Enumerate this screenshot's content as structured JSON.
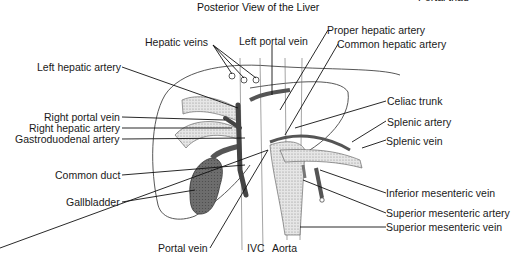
{
  "title": "Posterior View of the Liver",
  "corner_label": "Portal triad",
  "labels": {
    "hepatic_veins": "Hepatic veins",
    "left_portal_vein": "Left portal vein",
    "proper_hepatic_artery": "Proper hepatic artery",
    "common_hepatic_artery": "Common hepatic artery",
    "left_hepatic_artery": "Left hepatic artery",
    "right_portal_vein": "Right portal vein",
    "right_hepatic_artery": "Right hepatic artery",
    "gastroduodenal_artery": "Gastroduodenal artery",
    "celiac_trunk": "Celiac trunk",
    "splenic_artery": "Splenic artery",
    "splenic_vein": "Splenic vein",
    "common_duct": "Common duct",
    "gallbladder": "Gallbladder",
    "inferior_mesenteric_vein": "Inferior mesenteric vein",
    "superior_mesenteric_artery": "Superior mesenteric artery",
    "superior_mesenteric_vein": "Superior mesenteric vein",
    "portal_vein": "Portal vein",
    "ivc": "IVC",
    "aorta": "Aorta"
  }
}
